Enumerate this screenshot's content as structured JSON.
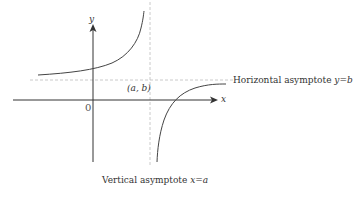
{
  "diagram": {
    "axes": {
      "x_label": "x",
      "y_label": "y",
      "origin_label": "0"
    },
    "point": {
      "label": "(a, b)"
    },
    "asymptotes": {
      "horizontal": {
        "prefix": "Horizontal asymptote ",
        "equation": "y=b"
      },
      "vertical": {
        "prefix": "Vertical asymptote ",
        "equation": "x=a"
      }
    },
    "colors": {
      "axis": "#333333",
      "curve": "#444444",
      "asymptote": "#bbbbbb",
      "text": "#333333"
    }
  }
}
